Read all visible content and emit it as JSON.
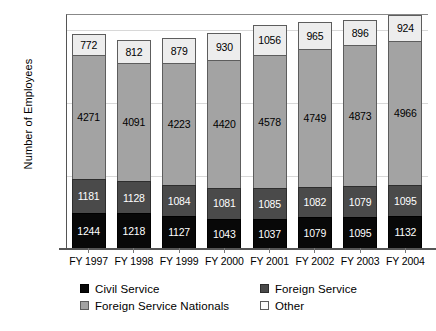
{
  "chart_data": {
    "type": "bar",
    "stacked": true,
    "title": "",
    "xlabel": "",
    "ylabel": "Number of Employees",
    "ylim": [
      0,
      8000
    ],
    "yticks": [
      0,
      2500,
      5000,
      7500
    ],
    "ytick_labels": [
      "0",
      "2500",
      "5000",
      "7500"
    ],
    "grid": true,
    "legend_position": "bottom",
    "categories": [
      "FY 1997",
      "FY 1998",
      "FY 1999",
      "FY 2000",
      "FY 2001",
      "FY 2002",
      "FY 2003",
      "FY 2004"
    ],
    "series": [
      {
        "name": "Civil Service",
        "color": "#080808",
        "label_color": "#ffffff",
        "values": [
          1244,
          1218,
          1127,
          1043,
          1037,
          1079,
          1095,
          1132
        ]
      },
      {
        "name": "Foreign Service",
        "color": "#4a4a4a",
        "label_color": "#ffffff",
        "values": [
          1181,
          1128,
          1084,
          1081,
          1085,
          1082,
          1079,
          1095
        ]
      },
      {
        "name": "Foreign Service Nationals",
        "color": "#a3a3a3",
        "label_color": "#000000",
        "values": [
          4271,
          4091,
          4223,
          4420,
          4578,
          4749,
          4873,
          4966
        ]
      },
      {
        "name": "Other",
        "color": "#ededed",
        "label_color": "#000000",
        "values": [
          772,
          812,
          879,
          930,
          1056,
          965,
          896,
          924
        ]
      }
    ],
    "totals": [
      7468,
      7249,
      7313,
      7474,
      7756,
      7875,
      7943,
      8117
    ]
  },
  "legend": {
    "items": [
      {
        "label": "Civil Service",
        "swatch": "sw-civil"
      },
      {
        "label": "Foreign Service",
        "swatch": "sw-fs"
      },
      {
        "label": "Foreign Service Nationals",
        "swatch": "sw-fsn"
      },
      {
        "label": "Other",
        "swatch": "sw-other"
      }
    ]
  }
}
